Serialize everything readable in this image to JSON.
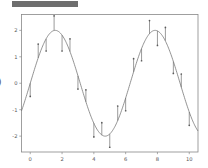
{
  "toolbar": {
    "bar_label": "",
    "color": "#6e6e6e"
  },
  "figure": {
    "ylabel_text": ")",
    "background": "#ffffff",
    "frame_color": "#888888",
    "line_color": "#707070"
  },
  "chart_data": {
    "type": "line",
    "title": "",
    "xlabel": "",
    "ylabel": ")",
    "xlim": [
      -0.55,
      10.55
    ],
    "ylim": [
      -2.6,
      2.6
    ],
    "grid": false,
    "legend": null,
    "xticks": [
      0,
      2,
      4,
      6,
      8,
      10
    ],
    "xticklabels": [
      "0",
      "2",
      "4",
      "6",
      "8",
      "10"
    ],
    "yticks": [
      -2,
      -1,
      0,
      1,
      2
    ],
    "yticklabels": [
      "-2",
      "-1",
      "0",
      "1",
      "2"
    ],
    "series": [
      {
        "name": "2*sin(x)",
        "style": "line-with-errorbars",
        "x": [
          0.0,
          0.5,
          1.0,
          1.5,
          2.0,
          2.5,
          3.0,
          3.5,
          4.0,
          4.5,
          5.0,
          5.5,
          6.0,
          6.5,
          7.0,
          7.5,
          8.0,
          8.5,
          9.0,
          9.5,
          10.0
        ],
        "y": [
          0.0,
          0.96,
          1.68,
          2.0,
          1.82,
          1.2,
          0.28,
          -0.7,
          -1.51,
          -1.96,
          -1.92,
          -1.41,
          -0.56,
          0.43,
          1.31,
          1.87,
          1.98,
          1.61,
          0.82,
          -0.15,
          -1.09
        ],
        "yerr": [
          0.5,
          0.52,
          0.46,
          0.55,
          0.6,
          0.48,
          0.5,
          0.45,
          0.52,
          0.47,
          0.5,
          0.55,
          0.48,
          0.5,
          0.46,
          0.5,
          0.55,
          0.5,
          0.45,
          0.5,
          0.5
        ]
      }
    ]
  }
}
